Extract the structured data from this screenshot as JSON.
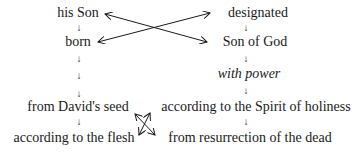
{
  "left_column": {
    "n1": "his Son",
    "n2": "born",
    "n3": "from David's seed",
    "n4": "according to the flesh"
  },
  "right_column": {
    "n1": "designated",
    "n2": "Son of God",
    "n3": "with power",
    "n4": "according to the Spirit of holiness",
    "n5": "from resurrection of the dead"
  },
  "arrow_glyph": "↓"
}
